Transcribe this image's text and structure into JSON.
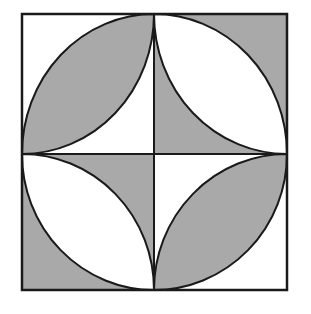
{
  "figure": {
    "colors": {
      "background": "#ffffff",
      "shade": "#a9a9a9",
      "stroke": "#1a1a1a"
    },
    "square": {
      "x0": 22,
      "y0": 14,
      "x1": 287,
      "y1": 290
    },
    "center": {
      "x": 154,
      "y": 154
    },
    "quadrants": [
      {
        "name": "top-left",
        "lens_shaded": true,
        "corners_shaded": false
      },
      {
        "name": "top-right",
        "lens_shaded": false,
        "corners_shaded": true
      },
      {
        "name": "bottom-left",
        "lens_shaded": false,
        "corners_shaded": true
      },
      {
        "name": "bottom-right",
        "lens_shaded": true,
        "corners_shaded": false
      }
    ]
  }
}
